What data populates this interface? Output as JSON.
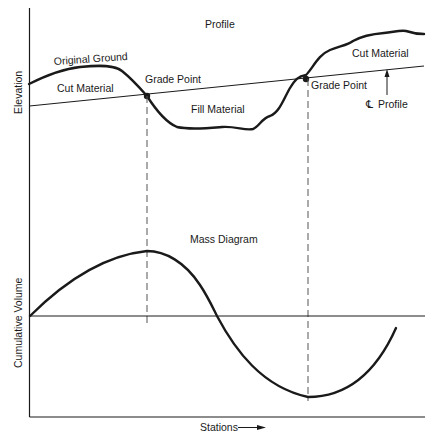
{
  "profile": {
    "title": "Profile",
    "y_axis_label": "Elevation",
    "original_ground_label": "Original Ground",
    "cut_material_left_label": "Cut Material",
    "cut_material_right_label": "Cut Material",
    "fill_material_label": "Fill Material",
    "grade_point_left_label": "Grade Point",
    "grade_point_right_label": "Grade Point",
    "centerline_symbol": "℄",
    "centerline_label": "Profile"
  },
  "mass_diagram": {
    "title": "Mass Diagram",
    "y_axis_label": "Cumulative Volume"
  },
  "x_axis": {
    "label": "Stations",
    "arrow": "→"
  },
  "colors": {
    "line": "#1a1a1a",
    "dashed": "#555555",
    "background": "#ffffff"
  }
}
